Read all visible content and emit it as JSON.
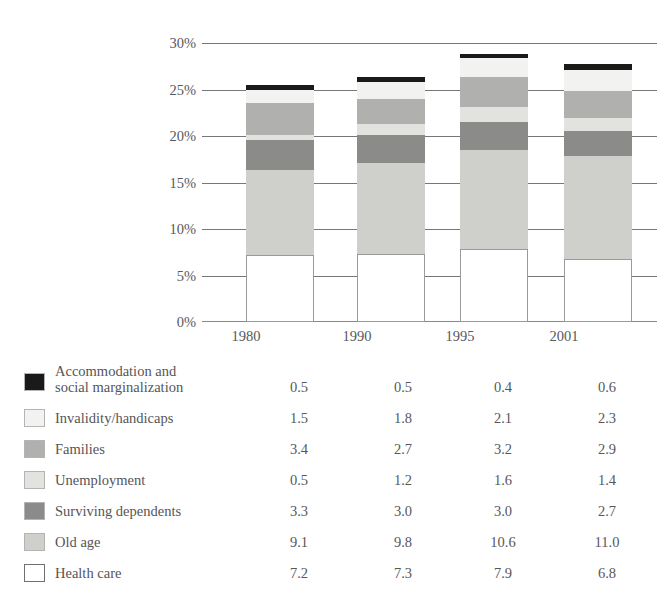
{
  "chart_data": {
    "type": "bar",
    "stacked": true,
    "title": "",
    "xlabel": "",
    "ylabel": "",
    "categories": [
      "1980",
      "1990",
      "1995",
      "2001"
    ],
    "ylim": [
      0,
      30
    ],
    "ytick_labels": [
      "0%",
      "5%",
      "10%",
      "15%",
      "20%",
      "25%",
      "30%"
    ],
    "ytick_values": [
      0,
      5,
      10,
      15,
      20,
      25,
      30
    ],
    "grid": true,
    "legend_position": "below-left",
    "unit": "%",
    "stack_order_bottom_to_top": [
      "Health care",
      "Old age",
      "Surviving dependents",
      "Unemployment",
      "Families",
      "Invalidity/handicaps",
      "Accommodation and social marginalization"
    ],
    "series": [
      {
        "name": "Accommodation and social marginalization",
        "name_line1": "Accommodation and",
        "name_line2": "social marginalization",
        "color": "#1a1a1a",
        "values": [
          0.5,
          0.5,
          0.4,
          0.6
        ],
        "labels": [
          "0.5",
          "0.5",
          "0.4",
          "0.6"
        ]
      },
      {
        "name": "Invalidity/handicaps",
        "color": "#f2f2f0",
        "values": [
          1.5,
          1.8,
          2.1,
          2.3
        ],
        "labels": [
          "1.5",
          "1.8",
          "2.1",
          "2.3"
        ]
      },
      {
        "name": "Families",
        "color": "#b0b0ae",
        "values": [
          3.4,
          2.7,
          3.2,
          2.9
        ],
        "labels": [
          "3.4",
          "2.7",
          "3.2",
          "2.9"
        ]
      },
      {
        "name": "Unemployment",
        "color": "#e2e2df",
        "values": [
          0.5,
          1.2,
          1.6,
          1.4
        ],
        "labels": [
          "0.5",
          "1.2",
          "1.6",
          "1.4"
        ]
      },
      {
        "name": "Surviving dependents",
        "color": "#8b8b89",
        "values": [
          3.3,
          3.0,
          3.0,
          2.7
        ],
        "labels": [
          "3.3",
          "3.0",
          "3.0",
          "2.7"
        ]
      },
      {
        "name": "Old age",
        "color": "#cfcfcc",
        "values": [
          9.1,
          9.8,
          10.6,
          11.0
        ],
        "labels": [
          "9.1",
          "9.8",
          "10.6",
          "11.0"
        ]
      },
      {
        "name": "Health care",
        "color": "#ffffff",
        "values": [
          7.2,
          7.3,
          7.9,
          6.8
        ],
        "labels": [
          "7.2",
          "7.3",
          "7.9",
          "6.8"
        ]
      }
    ],
    "column_totals": [
      25.5,
      26.3,
      28.8,
      27.7
    ]
  }
}
